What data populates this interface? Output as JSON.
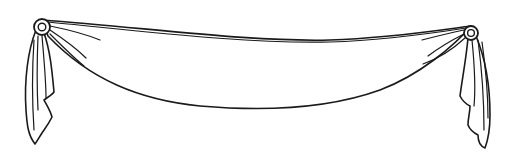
{
  "illustration": {
    "subject": "swag drape with rosettes and side tails",
    "line_color": "#1a1a1a",
    "background": "#ffffff"
  }
}
